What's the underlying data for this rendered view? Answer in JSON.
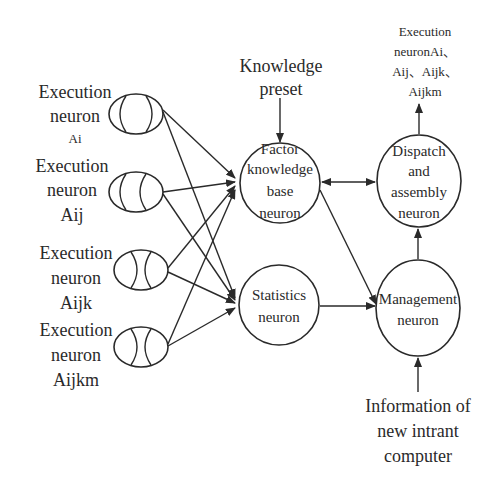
{
  "diagram": {
    "top_label": [
      "Knowledge",
      "preset"
    ],
    "output_label": [
      "Execution",
      "neuronAi、",
      "Aij、Aijk、",
      "Aijkm"
    ],
    "input_label": [
      "Information of",
      "new intrant",
      "computer"
    ],
    "execution_neurons": [
      {
        "lines": [
          "Execution",
          "neuron",
          "Ai"
        ]
      },
      {
        "lines": [
          "Execution",
          "neuron",
          "Aij"
        ]
      },
      {
        "lines": [
          "Execution",
          "neuron",
          "Aijk"
        ]
      },
      {
        "lines": [
          "Execution",
          "neuron",
          "Aijkm"
        ]
      }
    ],
    "factor_knowledge_neuron": [
      "Factor",
      "knowledge",
      "base",
      "neuron"
    ],
    "statistics_neuron": [
      "Statistics",
      "neuron"
    ],
    "dispatch_neuron": [
      "Dispatch",
      "and",
      "assembly",
      "neuron"
    ],
    "management_neuron": [
      "Management",
      "neuron"
    ],
    "edges": [
      "Execution Ai -> Factor knowledge base neuron",
      "Execution Ai -> Statistics neuron",
      "Execution Aij -> Factor knowledge base neuron",
      "Execution Aij -> Statistics neuron",
      "Execution Aijk -> Factor knowledge base neuron",
      "Execution Aijk -> Statistics neuron",
      "Execution Aijkm -> Factor knowledge base neuron",
      "Execution Aijkm -> Statistics neuron",
      "Knowledge preset -> Factor knowledge base neuron",
      "Factor knowledge base neuron <-> Dispatch and assembly neuron",
      "Factor knowledge base neuron -> Management neuron",
      "Statistics neuron -> Management neuron",
      "Management neuron -> Dispatch and assembly neuron",
      "Dispatch and assembly neuron -> Execution output",
      "Information of new intrant computer -> Management neuron"
    ]
  }
}
